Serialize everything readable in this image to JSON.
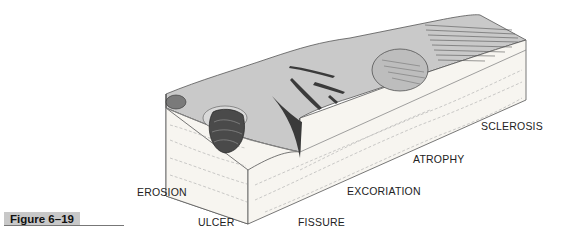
{
  "figure": {
    "label": "Figure 6–19"
  },
  "illustration": {
    "subject": "skin block diagram showing secondary skin lesions",
    "colors": {
      "surface": "#c9c9c9",
      "surface_dark": "#a8a8a8",
      "dermis": "#f7f5f0",
      "outline": "#555555",
      "lesion_dark": "#3a3a3a"
    }
  },
  "labels": {
    "erosion": "EROSION",
    "ulcer": "ULCER",
    "fissure": "FISSURE",
    "excoriation": "EXCORIATION",
    "atrophy": "ATROPHY",
    "sclerosis": "SCLEROSIS"
  }
}
